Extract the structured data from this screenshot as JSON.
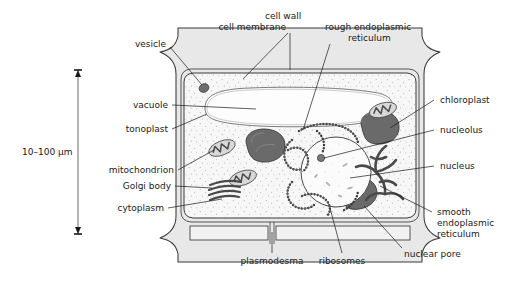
{
  "figure": {
    "background_color": "#ffffff",
    "ink_color": "#1a1a1a",
    "wall_fill": "#e8e8e8",
    "cytoplasm_fill": "#f7f7f7",
    "vacuole_fill": "#fcfcfc",
    "organelle_dark": "#555555",
    "organelle_mid": "#8a8a8a"
  },
  "scale": {
    "label": "10–100 μm",
    "orientation": "vertical",
    "arrow": "double-headed"
  },
  "labels": [
    {
      "id": "cell-membrane",
      "text": "cell membrane",
      "lines": [
        "cell membrane"
      ],
      "side": "top"
    },
    {
      "id": "cell-wall",
      "text": "cell wall",
      "lines": [
        "cell wall"
      ],
      "side": "top"
    },
    {
      "id": "rough-er",
      "text": "rough endoplasmic reticulum",
      "lines": [
        "rough endoplasmic",
        "reticulum"
      ],
      "side": "top"
    },
    {
      "id": "vesicle",
      "text": "vesicle",
      "lines": [
        "vesicle"
      ],
      "side": "left"
    },
    {
      "id": "vacuole",
      "text": "vacuole",
      "lines": [
        "vacuole"
      ],
      "side": "left"
    },
    {
      "id": "tonoplast",
      "text": "tonoplast",
      "lines": [
        "tonoplast"
      ],
      "side": "left"
    },
    {
      "id": "mitochondrion",
      "text": "mitochondrion",
      "lines": [
        "mitochondrion"
      ],
      "side": "left"
    },
    {
      "id": "golgi-body",
      "text": "Golgi body",
      "lines": [
        "Golgi body"
      ],
      "side": "left"
    },
    {
      "id": "cytoplasm",
      "text": "cytoplasm",
      "lines": [
        "cytoplasm"
      ],
      "side": "left"
    },
    {
      "id": "chloroplast",
      "text": "chloroplast",
      "lines": [
        "chloroplast"
      ],
      "side": "right"
    },
    {
      "id": "nucleolus",
      "text": "nucleolus",
      "lines": [
        "nucleolus"
      ],
      "side": "right"
    },
    {
      "id": "nucleus",
      "text": "nucleus",
      "lines": [
        "nucleus"
      ],
      "side": "right"
    },
    {
      "id": "smooth-er",
      "text": "smooth endoplasmic reticulum",
      "lines": [
        "smooth",
        "endoplasmic",
        "reticulum"
      ],
      "side": "right"
    },
    {
      "id": "plasmodesma",
      "text": "plasmodesma",
      "lines": [
        "plasmodesma"
      ],
      "side": "bottom"
    },
    {
      "id": "ribosomes",
      "text": "ribosomes",
      "lines": [
        "ribosomes"
      ],
      "side": "bottom"
    },
    {
      "id": "nuclear-pore",
      "text": "nuclear pore",
      "lines": [
        "nuclear pore"
      ],
      "side": "bottom"
    }
  ],
  "text": {
    "cell_membrane": "cell membrane",
    "cell_wall": "cell wall",
    "rough_er_1": "rough endoplasmic",
    "rough_er_2": "reticulum",
    "vesicle": "vesicle",
    "vacuole": "vacuole",
    "tonoplast": "tonoplast",
    "mitochondrion": "mitochondrion",
    "golgi_body": "Golgi body",
    "cytoplasm": "cytoplasm",
    "chloroplast": "chloroplast",
    "nucleolus": "nucleolus",
    "nucleus": "nucleus",
    "smooth_er_1": "smooth",
    "smooth_er_2": "endoplasmic",
    "smooth_er_3": "reticulum",
    "plasmodesma": "plasmodesma",
    "ribosomes": "ribosomes",
    "nuclear_pore": "nuclear pore",
    "scale_label": "10–100 μm"
  }
}
